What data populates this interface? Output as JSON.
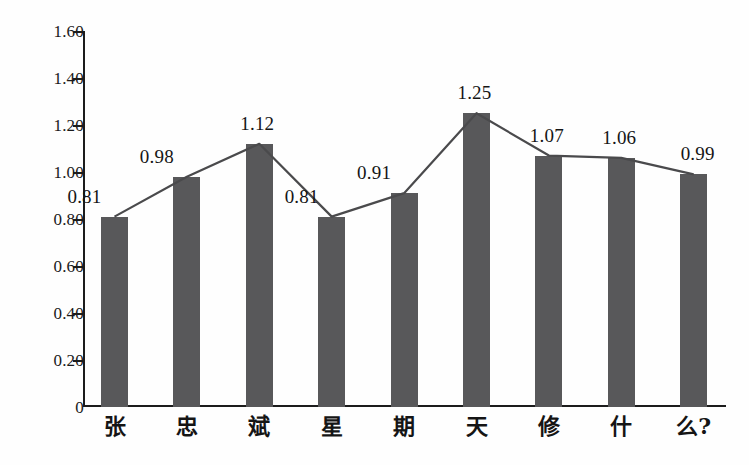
{
  "chart_data": {
    "type": "bar",
    "title": "",
    "subtitle": "",
    "xlabel": "",
    "ylabel": "",
    "categories": [
      "张",
      "忠",
      "斌",
      "星",
      "期",
      "天",
      "修",
      "什",
      "么?"
    ],
    "values": [
      0.81,
      0.98,
      1.12,
      0.81,
      0.91,
      1.25,
      1.07,
      1.06,
      0.99
    ],
    "value_labels": [
      "0.81",
      "0.98",
      "1.12",
      "0.81",
      "0.91",
      "1.25",
      "1.07",
      "1.06",
      "0.99"
    ],
    "series": [
      {
        "name": "bars",
        "type": "bar",
        "values": [
          0.81,
          0.98,
          1.12,
          0.81,
          0.91,
          1.25,
          1.07,
          1.06,
          0.99
        ]
      },
      {
        "name": "trend-line",
        "type": "line",
        "values": [
          0.81,
          0.98,
          1.12,
          0.81,
          0.91,
          1.25,
          1.07,
          1.06,
          0.99
        ]
      }
    ],
    "ylim": [
      0,
      1.6
    ],
    "ytick_values": [
      0,
      0.2,
      0.4,
      0.6,
      0.8,
      1.0,
      1.2,
      1.4,
      1.6
    ],
    "ytick_labels": [
      "0",
      "0.20",
      "0.40",
      "0.60",
      "0.80",
      "1.00",
      "1.20",
      "1.40",
      "1.60"
    ],
    "grid": false,
    "legend": false,
    "legend_position": "none",
    "annotations": []
  },
  "style": {
    "bar_color": "#58585a",
    "line_color": "#4a4a4c",
    "axis_color": "#1c1c1c",
    "text_color": "#151515",
    "background": "#fefefe"
  }
}
